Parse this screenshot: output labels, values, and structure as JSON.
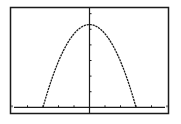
{
  "screen": {
    "background": "#ffffff",
    "ink": "#1a1a1a"
  },
  "chart_data": {
    "type": "line",
    "title": "",
    "xlabel": "",
    "ylabel": "",
    "xlim": [
      -5,
      5
    ],
    "ylim": [
      -0.3,
      6.3
    ],
    "x_tick_step": 1,
    "y_tick_step": 1,
    "grid": false,
    "legend": "none",
    "series": [
      {
        "name": "parabola",
        "equation": "y = 5.3 * (1 - (x/3)^2)",
        "x_range": [
          -3,
          3
        ],
        "points": [
          {
            "x": -3,
            "y": 0
          },
          {
            "x": -2.5,
            "y": 1.62
          },
          {
            "x": -2,
            "y": 2.94
          },
          {
            "x": -1.5,
            "y": 3.98
          },
          {
            "x": -1,
            "y": 4.71
          },
          {
            "x": -0.5,
            "y": 5.15
          },
          {
            "x": 0,
            "y": 5.3
          },
          {
            "x": 0.5,
            "y": 5.15
          },
          {
            "x": 1,
            "y": 4.71
          },
          {
            "x": 1.5,
            "y": 3.98
          },
          {
            "x": 2,
            "y": 2.94
          },
          {
            "x": 2.5,
            "y": 1.62
          },
          {
            "x": 3,
            "y": 0
          }
        ]
      }
    ]
  }
}
